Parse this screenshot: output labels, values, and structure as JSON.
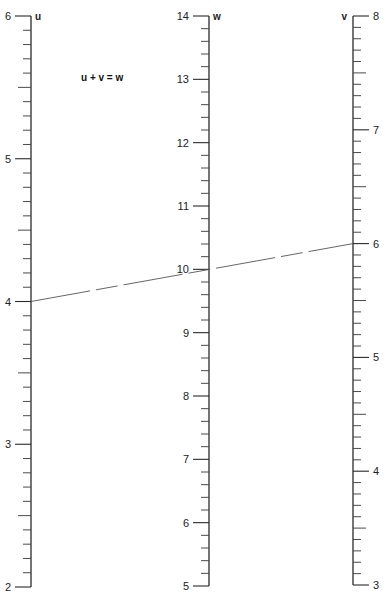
{
  "chart_data": {
    "type": "nomogram",
    "title": "",
    "equation": "u + v = w",
    "axes": [
      {
        "name": "u",
        "min": 2,
        "max": 6,
        "major_ticks": [
          2,
          3,
          4,
          5,
          6
        ],
        "minor_step": 0.1,
        "half_step": 0.5,
        "tick_side": "left",
        "label_side": "left",
        "x": 31,
        "y_top": 16,
        "y_bottom": 587
      },
      {
        "name": "w",
        "min": 5,
        "max": 14,
        "major_ticks": [
          5,
          6,
          7,
          8,
          9,
          10,
          11,
          12,
          13,
          14
        ],
        "minor_step": 0.2,
        "half_step": null,
        "tick_side": "left",
        "label_side": "left",
        "x": 209,
        "y_top": 16,
        "y_bottom": 586
      },
      {
        "name": "v",
        "min": 3,
        "max": 8,
        "major_ticks": [
          3,
          4,
          5,
          6,
          7,
          8
        ],
        "minor_step": 0.1,
        "half_step": 0.5,
        "tick_side": "right",
        "label_side": "right",
        "x": 353,
        "y_top": 16,
        "y_bottom": 585
      }
    ],
    "isopleth": {
      "style": "dashed",
      "points": [
        {
          "axis": "u",
          "value": 4
        },
        {
          "axis": "w",
          "value": 10
        },
        {
          "axis": "v",
          "value": 6
        }
      ]
    }
  },
  "labels": {
    "equation": "u + v = w",
    "u_axis_name": "u",
    "w_axis_name": "w",
    "v_axis_name": "v"
  }
}
